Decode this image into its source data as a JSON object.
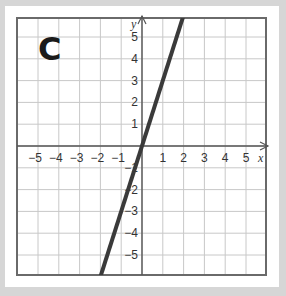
{
  "panel": {
    "label": "C"
  },
  "chart_data": {
    "type": "line",
    "title": "",
    "xlabel": "x",
    "ylabel": "y",
    "xlim": [
      -6,
      6
    ],
    "ylim": [
      -6,
      6
    ],
    "grid": true,
    "x_ticks": [
      "-5",
      "-4",
      "-3",
      "-2",
      "-1",
      "1",
      "2",
      "3",
      "4",
      "5"
    ],
    "y_ticks": [
      "5",
      "4",
      "3",
      "2",
      "1",
      "-1",
      "-2",
      "-3",
      "-4",
      "-5"
    ],
    "series": [
      {
        "name": "line",
        "equation": "y = 3x",
        "x": [
          -2,
          2
        ],
        "y": [
          -6,
          6
        ],
        "color": "#3a3a3a"
      }
    ]
  },
  "colors": {
    "grid": "#c8c8c8",
    "axis": "#555555",
    "frame": "#6a6a6a",
    "line": "#3a3a3a",
    "background": "#d6d6d6"
  }
}
